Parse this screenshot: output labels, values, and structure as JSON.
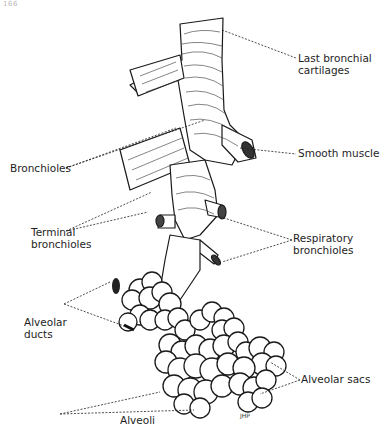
{
  "page": {
    "number": "166"
  },
  "figure": {
    "artist_initials": "JHP",
    "labels": {
      "last_bronchial_cartilages": {
        "line1": "Last bronchial",
        "line2": "cartilages"
      },
      "smooth_muscle": {
        "line1": "Smooth muscle"
      },
      "bronchioles": {
        "line1": "Bronchioles"
      },
      "terminal_bronchioles": {
        "line1": "Terminal",
        "line2": "bronchioles"
      },
      "respiratory_bronchioles": {
        "line1": "Respiratory",
        "line2": "bronchioles"
      },
      "alveolar_ducts": {
        "line1": "Alveolar",
        "line2": "ducts"
      },
      "alveolar_sacs": {
        "line1": "Alveolar sacs"
      },
      "alveoli": {
        "line1": "Alveoli"
      }
    }
  }
}
